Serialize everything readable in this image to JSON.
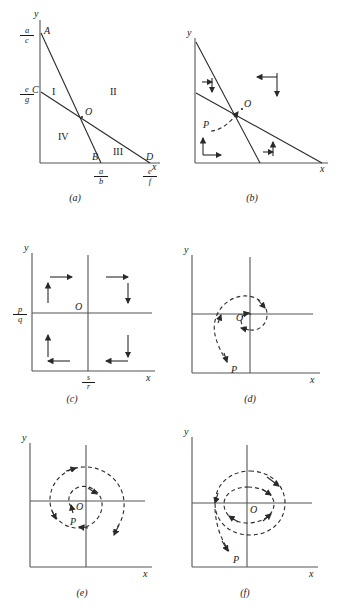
{
  "figure": {
    "background": "#ffffff",
    "line_color": "#2a2a2a",
    "axis_color": "#555555"
  },
  "panels": [
    {
      "id": "a",
      "caption": "(a)",
      "axis_y_label": "y",
      "axis_x_label": "x",
      "points": [
        {
          "name": "A",
          "label": "A"
        },
        {
          "name": "C",
          "label": "C"
        },
        {
          "name": "O",
          "label": "O"
        },
        {
          "name": "B",
          "label": "B"
        },
        {
          "name": "D",
          "label": "D"
        }
      ],
      "regions": [
        {
          "label": "I"
        },
        {
          "label": "II"
        },
        {
          "label": "III"
        },
        {
          "label": "IV"
        }
      ],
      "intercepts": [
        {
          "axis": "y",
          "point": "A",
          "numerator": "a",
          "denominator": "c"
        },
        {
          "axis": "y",
          "point": "C",
          "numerator": "e",
          "denominator": "g"
        },
        {
          "axis": "x",
          "point": "B",
          "numerator": "a",
          "denominator": "b"
        },
        {
          "axis": "x",
          "point": "D",
          "numerator": "e",
          "denominator": "f"
        }
      ]
    },
    {
      "id": "b",
      "caption": "(b)",
      "axis_y_label": "y",
      "axis_x_label": "x",
      "origin_label": "O",
      "trajectory_label": "P",
      "arrow_groups": [
        {
          "region": "I",
          "directions": [
            "right",
            "down"
          ]
        },
        {
          "region": "II",
          "directions": [
            "left",
            "down"
          ]
        },
        {
          "region": "III",
          "directions": [
            "right",
            "up"
          ]
        },
        {
          "region": "IV",
          "directions": [
            "up",
            "right"
          ]
        }
      ]
    },
    {
      "id": "c",
      "caption": "(c)",
      "axis_y_label": "y",
      "axis_x_label": "x",
      "origin_label": "O",
      "nullclines": [
        {
          "orientation": "horizontal",
          "numerator": "p",
          "denominator": "q"
        },
        {
          "orientation": "vertical",
          "numerator": "s",
          "denominator": "r"
        }
      ],
      "arrow_groups": [
        {
          "quadrant": "upper-left",
          "directions": [
            "up",
            "right"
          ]
        },
        {
          "quadrant": "upper-right",
          "directions": [
            "right",
            "down"
          ]
        },
        {
          "quadrant": "lower-left",
          "directions": [
            "up",
            "left"
          ]
        },
        {
          "quadrant": "lower-right",
          "directions": [
            "down",
            "left"
          ]
        }
      ]
    },
    {
      "id": "d",
      "caption": "(d)",
      "axis_y_label": "y",
      "axis_x_label": "x",
      "origin_label": "O",
      "trajectory_label": "P",
      "trajectory_type": "inward-spiral"
    },
    {
      "id": "e",
      "caption": "(e)",
      "axis_y_label": "y",
      "axis_x_label": "x",
      "origin_label": "O",
      "trajectory_label": "P",
      "trajectory_type": "outward-spiral"
    },
    {
      "id": "f",
      "caption": "(f)",
      "axis_y_label": "y",
      "axis_x_label": "x",
      "origin_label": "O",
      "trajectory_label": "P",
      "trajectory_type": "closed-orbits"
    }
  ]
}
